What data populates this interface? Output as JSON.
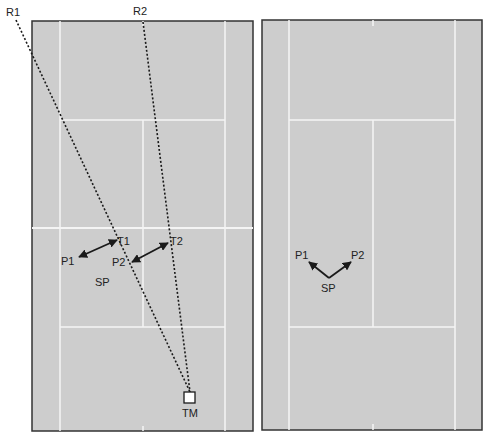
{
  "colors": {
    "court": "#cdcdcd",
    "lines": "#f4f4f4",
    "border": "#333333",
    "ink": "#1a1a1a"
  },
  "left_court": {
    "rays": [
      {
        "label": "R1"
      },
      {
        "label": "R2"
      }
    ],
    "targets": [
      {
        "label": "T1"
      },
      {
        "label": "T2"
      }
    ],
    "players": [
      {
        "label": "P1"
      },
      {
        "label": "P2"
      }
    ],
    "start_point": {
      "label": "SP"
    },
    "marker": {
      "label": "TM"
    }
  },
  "right_court": {
    "players": [
      {
        "label": "P1"
      },
      {
        "label": "P2"
      }
    ],
    "start_point": {
      "label": "SP"
    }
  }
}
